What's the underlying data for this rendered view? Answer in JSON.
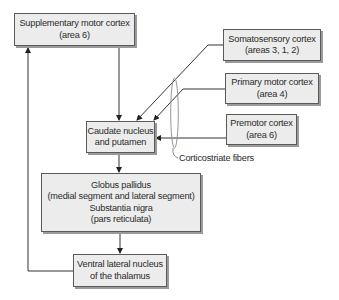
{
  "diagram": {
    "type": "flowchart",
    "nodes": {
      "supplementary": {
        "line1": "Supplementary motor cortex",
        "line2": "(area 6)"
      },
      "somatosensory": {
        "line1": "Somatosensory cortex",
        "line2": "(areas 3, 1, 2)"
      },
      "primary_motor": {
        "line1": "Primary motor cortex",
        "line2": "(area 4)"
      },
      "premotor": {
        "line1": "Premotor cortex",
        "line2": "(area 6)"
      },
      "caudate": {
        "line1": "Caudate nucleus",
        "line2": "and putamen"
      },
      "globus": {
        "line1": "Globus pallidus",
        "line2": "(medial segment and lateral segment)",
        "line3": "Substantia nigra",
        "line4": "(pars reticulata)"
      },
      "ventral": {
        "line1": "Ventral lateral nucleus",
        "line2": "of the thalamus"
      }
    },
    "annotations": {
      "corticostriate": "Corticostriate fibers"
    },
    "edges": [
      {
        "from": "Supplementary motor cortex (area 6)",
        "to": "Caudate nucleus and putamen"
      },
      {
        "from": "Somatosensory cortex (areas 3, 1, 2)",
        "to": "Caudate nucleus and putamen"
      },
      {
        "from": "Primary motor cortex (area 4)",
        "to": "Caudate nucleus and putamen"
      },
      {
        "from": "Premotor cortex (area 6)",
        "to": "Caudate nucleus and putamen"
      },
      {
        "from": "Caudate nucleus and putamen",
        "to": "Globus pallidus / Substantia nigra"
      },
      {
        "from": "Globus pallidus / Substantia nigra",
        "to": "Ventral lateral nucleus of the thalamus"
      },
      {
        "from": "Ventral lateral nucleus of the thalamus",
        "to": "Supplementary motor cortex (area 6)"
      }
    ],
    "colors": {
      "box_fill": "#ececec",
      "box_border": "#5a5a5a",
      "box_shadow": "#9a9a9a",
      "line": "#333333",
      "ellipse": "#8a8a8a"
    }
  }
}
